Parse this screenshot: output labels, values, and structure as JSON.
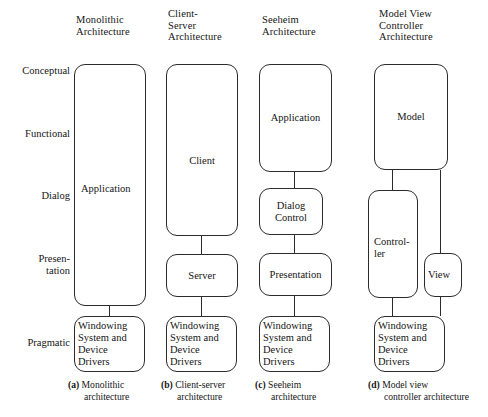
{
  "figure": {
    "column_headers": [
      {
        "id": "monolithic",
        "text": "Monolithic\nArchitecture"
      },
      {
        "id": "client-server",
        "text": "Client-\nServer\nArchitecture"
      },
      {
        "id": "seeheim",
        "text": "Seeheim\nArchitecture"
      },
      {
        "id": "model-view-controller",
        "text": "Model View\nController\nArchitecture"
      }
    ],
    "axis_labels": [
      {
        "id": "conceptual",
        "text": "Conceptual"
      },
      {
        "id": "functional",
        "text": "Functional"
      },
      {
        "id": "dialog",
        "text": "Dialog"
      },
      {
        "id": "presentation",
        "text": "Presen-\ntation"
      },
      {
        "id": "pragmatic",
        "text": "Pragmatic"
      }
    ],
    "nodes": {
      "monolithic_application": "Application",
      "monolithic_windowing": "Windowing\nSystem and\nDevice\nDrivers",
      "cs_client": "Client",
      "cs_server": "Server",
      "cs_windowing": "Windowing\nSystem and\nDevice\nDrivers",
      "seeheim_application": "Application",
      "seeheim_dialog_control": "Dialog\nControl",
      "seeheim_presentation": "Presentation",
      "seeheim_windowing": "Windowing\nSystem and\nDevice\nDrivers",
      "mvc_model": "Model",
      "mvc_controller": "Control-\nler",
      "mvc_view": "View",
      "mvc_windowing": "Windowing\nSystem and\nDevice\nDrivers"
    },
    "captions": [
      {
        "id": "a",
        "tag": "(a)",
        "line1": "Monolithic",
        "line2": "architecture"
      },
      {
        "id": "b",
        "tag": "(b)",
        "line1": "Client-server",
        "line2": "architecture"
      },
      {
        "id": "c",
        "tag": "(c)",
        "line1": "Seeheim",
        "line2": "architecture"
      },
      {
        "id": "d",
        "tag": "(d)",
        "line1": "Model view",
        "line2": "controller architecture"
      }
    ],
    "colors": {
      "background": "#ffffff",
      "stroke": "#2b2b2b",
      "text": "#151515"
    }
  }
}
